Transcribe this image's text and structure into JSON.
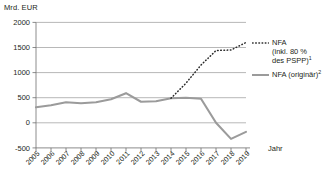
{
  "chart_data": {
    "type": "line",
    "title": "",
    "xlabel": "Jahr",
    "ylabel": "Mrd. EUR",
    "ylim": [
      -500,
      2000
    ],
    "yticks": [
      -500,
      0,
      500,
      1000,
      1500,
      2000
    ],
    "grid": true,
    "legend_position": "right",
    "categories": [
      2005,
      2006,
      2007,
      2008,
      2009,
      2010,
      2011,
      2012,
      2013,
      2014,
      2015,
      2016,
      2017,
      2018,
      2019
    ],
    "series": [
      {
        "name": "NFA (inkl. 80 % des PSPP)",
        "footnote": "1",
        "style": "dotted",
        "color": "#2b2b2b",
        "x": [
          2014,
          2015,
          2016,
          2017,
          2018,
          2019
        ],
        "values": [
          490,
          790,
          1150,
          1440,
          1450,
          1600
        ]
      },
      {
        "name": "NFA (originär)",
        "footnote": "2",
        "style": "solid",
        "color": "#9b9b9b",
        "x": [
          2005,
          2006,
          2007,
          2008,
          2009,
          2010,
          2011,
          2012,
          2013,
          2014,
          2015,
          2016,
          2017,
          2018,
          2019
        ],
        "values": [
          310,
          350,
          410,
          390,
          410,
          470,
          590,
          420,
          430,
          490,
          500,
          480,
          0,
          -320,
          -180
        ]
      }
    ]
  },
  "axis": {
    "unit_label": "Mrd. EUR",
    "x_title": "Jahr",
    "y_tick_labels": [
      "2000",
      "1500",
      "1000",
      "500",
      "0",
      "-500"
    ],
    "x_tick_labels": [
      "2005",
      "2006",
      "2007",
      "2008",
      "2009",
      "2010",
      "2011",
      "2012",
      "2013",
      "2014",
      "2015",
      "2016",
      "2017",
      "2018",
      "2019"
    ]
  },
  "legend": {
    "items": [
      {
        "label": "NFA\n(inkl. 80 %\ndes PSPP)",
        "footnote": "1",
        "swatch": "dotted-line-swatch"
      },
      {
        "label": "NFA (originär)",
        "footnote": "2",
        "swatch": "solid-line-swatch"
      }
    ]
  }
}
